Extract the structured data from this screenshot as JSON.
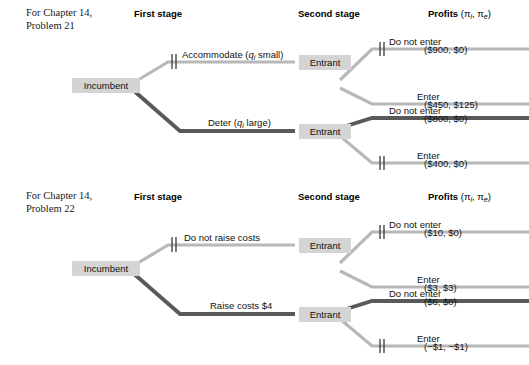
{
  "figure": {
    "headers": {
      "first_stage": "First stage",
      "second_stage": "Second stage",
      "profits": "Profits",
      "profits_args": "(πi, πe)"
    },
    "colors": {
      "node_fill": "#d4d4d4",
      "branch_light": "#b8b8b8",
      "branch_dark": "#595959",
      "text": "#111111"
    }
  },
  "trees": [
    {
      "caption_line1": "For Chapter 14,",
      "caption_line2": "Problem 21",
      "root_node": "Incumbent",
      "branches": [
        {
          "label_text": "Accommodate (",
          "label_var": "q",
          "label_sub": "i",
          "label_tail": " small)",
          "label_full": "Accommodate (qi small)",
          "style": "light",
          "pruned": true,
          "node": "Entrant",
          "children": [
            {
              "label": "Do not enter",
              "payoff": "($900, $0)",
              "style": "light",
              "pruned": true
            },
            {
              "label": "Enter",
              "payoff": "($450, $125)",
              "style": "light",
              "pruned": false
            }
          ]
        },
        {
          "label_text": "Deter (",
          "label_var": "q",
          "label_sub": "i",
          "label_tail": " large)",
          "label_full": "Deter (qi large)",
          "style": "dark",
          "pruned": false,
          "node": "Entrant",
          "children": [
            {
              "label": "Do not enter",
              "payoff": "($800, $0)",
              "style": "dark",
              "pruned": false
            },
            {
              "label": "Enter",
              "payoff": "($400, $0)",
              "style": "light",
              "pruned": true
            }
          ]
        }
      ]
    },
    {
      "caption_line1": "For Chapter 14,",
      "caption_line2": "Problem 22",
      "root_node": "Incumbent",
      "branches": [
        {
          "label_text": "Do not raise costs",
          "label_var": "",
          "label_sub": "",
          "label_tail": "",
          "label_full": "Do not raise costs",
          "style": "light",
          "pruned": true,
          "node": "Entrant",
          "children": [
            {
              "label": "Do not enter",
              "payoff": "($10, $0)",
              "style": "light",
              "pruned": true
            },
            {
              "label": "Enter",
              "payoff": "($3, $3)",
              "style": "light",
              "pruned": false
            }
          ]
        },
        {
          "label_text": "Raise costs $4",
          "label_var": "",
          "label_sub": "",
          "label_tail": "",
          "label_full": "Raise costs $4",
          "style": "dark",
          "pruned": false,
          "node": "Entrant",
          "children": [
            {
              "label": "Do not enter",
              "payoff": "($6, $0)",
              "style": "dark",
              "pruned": false
            },
            {
              "label": "Enter",
              "payoff": "(−$1, −$1)",
              "style": "light",
              "pruned": true
            }
          ]
        }
      ]
    }
  ]
}
